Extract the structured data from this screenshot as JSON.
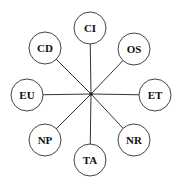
{
  "diagram": {
    "type": "hub-and-spoke",
    "hub": {
      "id": "center"
    },
    "nodes": [
      {
        "id": "CI",
        "label": "CI"
      },
      {
        "id": "OS",
        "label": "OS"
      },
      {
        "id": "ET",
        "label": "ET"
      },
      {
        "id": "NR",
        "label": "NR"
      },
      {
        "id": "TA",
        "label": "TA"
      },
      {
        "id": "NP",
        "label": "NP"
      },
      {
        "id": "EU",
        "label": "EU"
      },
      {
        "id": "CD",
        "label": "CD"
      }
    ],
    "edges": [
      {
        "from": "center",
        "to": "CI"
      },
      {
        "from": "center",
        "to": "OS"
      },
      {
        "from": "center",
        "to": "ET"
      },
      {
        "from": "center",
        "to": "NR"
      },
      {
        "from": "center",
        "to": "TA"
      },
      {
        "from": "center",
        "to": "NP"
      },
      {
        "from": "center",
        "to": "EU"
      },
      {
        "from": "center",
        "to": "CD"
      }
    ]
  }
}
